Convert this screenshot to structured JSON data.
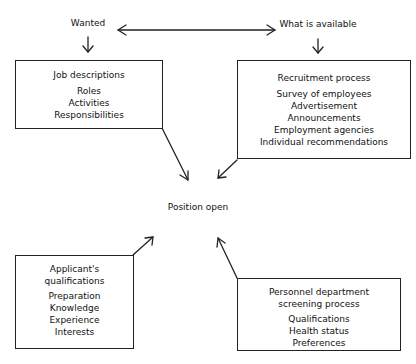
{
  "diagram": {
    "top_labels": {
      "wanted": "Wanted",
      "available": "What is available"
    },
    "center": "Position open",
    "boxes": {
      "job_descriptions": {
        "title": [
          "Job descriptions"
        ],
        "items": [
          "Roles",
          "Activities",
          "Responsibilities"
        ]
      },
      "recruitment": {
        "title": [
          "Recruitment process"
        ],
        "items": [
          "Survey of employees",
          "Advertisement",
          "Announcements",
          "Employment agencies",
          "Individual recommendations"
        ]
      },
      "applicant": {
        "title": [
          "Applicant's",
          "qualifications"
        ],
        "items": [
          "Preparation",
          "Knowledge",
          "Experience",
          "Interests"
        ]
      },
      "screening": {
        "title": [
          "Personnel department",
          "screening process"
        ],
        "items": [
          "Qualifications",
          "Health status",
          "Preferences"
        ]
      }
    },
    "connections": [
      {
        "from": "Wanted",
        "to": "What is available",
        "type": "bidirectional"
      },
      {
        "from": "Wanted",
        "to": "Job descriptions"
      },
      {
        "from": "What is available",
        "to": "Recruitment process"
      },
      {
        "from": "Job descriptions",
        "to": "Position open"
      },
      {
        "from": "Recruitment process",
        "to": "Position open"
      },
      {
        "from": "Applicant's qualifications",
        "to": "Position open"
      },
      {
        "from": "Personnel department screening process",
        "to": "Position open"
      }
    ]
  }
}
